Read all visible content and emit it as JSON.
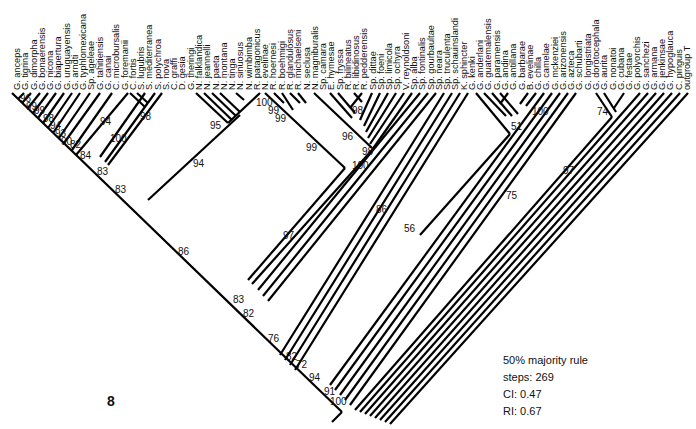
{
  "figure": {
    "number": "8",
    "legend": {
      "method": "50% majority rule",
      "steps": "steps: 269",
      "ci": "CI: 0.47",
      "ri": "RI: 0.67"
    }
  },
  "taxa": [
    "G. anceps",
    "G. tigrina",
    "G. dimorpha",
    "G. bonaerensis",
    "G. nicona",
    "G. biapertura",
    "G. uruguayensis",
    "G. arndti",
    "G. typhlomexicana",
    "Sp. ageleae",
    "G. tahitiensis",
    "G. canai",
    "C. microbursalis",
    "G. foremanii",
    "C. fortis",
    "S. lugubris",
    "S. mediterranea",
    "S. polychroa",
    "S. nova",
    "C. graffi",
    "D. gesia",
    "G. theringi",
    "N. falklandica",
    "N. jeannelli",
    "N. paeta",
    "N. montana",
    "N. tinga",
    "N. sinuosus",
    "N. wimbimba",
    "R. patagonicus",
    "N. evelinae",
    "R. hoernesi",
    "R. boehmigi",
    "R. glandulosus",
    "R. michaelseni",
    "N. seclusa",
    "N. magniburalis",
    "Sp. camara",
    "E. hymesae",
    "Sp. fryssa",
    "R. bilineatus",
    "R. libidinosus",
    "R. pedderensis",
    "Sp. dittae",
    "Sp. foeni",
    "Sp. limicola",
    "Sp. ochyra",
    "V. reynoldsoni",
    "Sp. alba",
    "Sp. fontinalis",
    "Sp. gourbaultae",
    "Sp. neara",
    "Sp. truculenta",
    "Sp. schauinslandi",
    "K. sphincter",
    "G. kenki",
    "G. anderlani",
    "G. guatemalensis",
    "G. paramensis",
    "G. andina",
    "G. antillana",
    "G. barbarae",
    "B. evelinae",
    "G. chilla",
    "G. camelae",
    "G. mckenziei",
    "G. arizonensis",
    "G. azteca",
    "G. schubarti",
    "G. longistriata",
    "G. dorotocephala",
    "G. aurita",
    "G. nonatoi",
    "G. cubana",
    "G. festae",
    "G. polyorchis",
    "G. sanchezi",
    "G. armana",
    "G. jenkinsae",
    "G. hypoglauca",
    "C. pinguis",
    "outgroup T"
  ],
  "support_values": [
    {
      "value": "96",
      "x": 20,
      "y": 99
    },
    {
      "value": "99",
      "x": 26,
      "y": 107
    },
    {
      "value": "99",
      "x": 34,
      "y": 111
    },
    {
      "value": "98",
      "x": 43,
      "y": 119
    },
    {
      "value": "94",
      "x": 50,
      "y": 126
    },
    {
      "value": "93",
      "x": 55,
      "y": 134
    },
    {
      "value": "90",
      "x": 61,
      "y": 142
    },
    {
      "value": "82",
      "x": 70,
      "y": 145
    },
    {
      "value": "84",
      "x": 80,
      "y": 156
    },
    {
      "value": "83",
      "x": 97,
      "y": 172
    },
    {
      "value": "83",
      "x": 115,
      "y": 190
    },
    {
      "value": "94",
      "x": 100,
      "y": 122
    },
    {
      "value": "100",
      "x": 110,
      "y": 139
    },
    {
      "value": "98",
      "x": 140,
      "y": 117
    },
    {
      "value": "95",
      "x": 210,
      "y": 126
    },
    {
      "value": "94",
      "x": 193,
      "y": 164
    },
    {
      "value": "100",
      "x": 256,
      "y": 103
    },
    {
      "value": "99",
      "x": 268,
      "y": 111
    },
    {
      "value": "99",
      "x": 275,
      "y": 119
    },
    {
      "value": "99",
      "x": 306,
      "y": 148
    },
    {
      "value": "98",
      "x": 352,
      "y": 111
    },
    {
      "value": "96",
      "x": 342,
      "y": 137
    },
    {
      "value": "98",
      "x": 362,
      "y": 152
    },
    {
      "value": "100",
      "x": 352,
      "y": 166
    },
    {
      "value": "51",
      "x": 511,
      "y": 127
    },
    {
      "value": "100",
      "x": 532,
      "y": 112
    },
    {
      "value": "74",
      "x": 597,
      "y": 112
    },
    {
      "value": "97",
      "x": 563,
      "y": 171
    },
    {
      "value": "75",
      "x": 506,
      "y": 196
    },
    {
      "value": "86",
      "x": 376,
      "y": 210
    },
    {
      "value": "56",
      "x": 404,
      "y": 229
    },
    {
      "value": "97",
      "x": 283,
      "y": 236
    },
    {
      "value": "86",
      "x": 178,
      "y": 252
    },
    {
      "value": "83",
      "x": 233,
      "y": 300
    },
    {
      "value": "82",
      "x": 243,
      "y": 314
    },
    {
      "value": "76",
      "x": 268,
      "y": 339
    },
    {
      "value": "82",
      "x": 286,
      "y": 357
    },
    {
      "value": "72",
      "x": 296,
      "y": 365
    },
    {
      "value": "94",
      "x": 309,
      "y": 378
    },
    {
      "value": "91",
      "x": 324,
      "y": 392
    },
    {
      "value": "100",
      "x": 330,
      "y": 402
    }
  ]
}
